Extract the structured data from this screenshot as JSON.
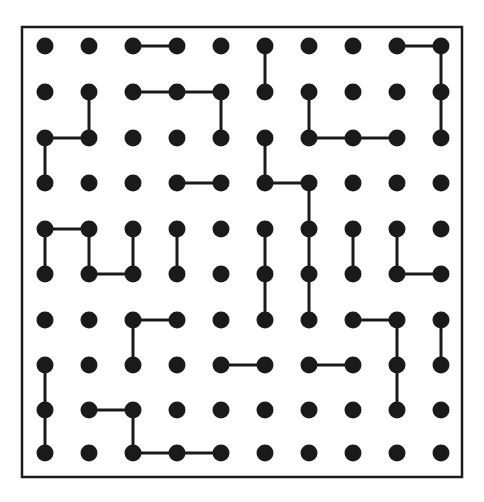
{
  "canvas": {
    "width": 484,
    "height": 502,
    "background": "#ffffff"
  },
  "frame": {
    "label": "puzzle-border",
    "x": 22,
    "y": 27,
    "width": 440,
    "height": 450,
    "stroke": "#1a1a1a",
    "stroke_width": 2.5,
    "fill": "#ffffff"
  },
  "grid": {
    "rows": 10,
    "cols": 10,
    "col_x": [
      45,
      89,
      133,
      177,
      221,
      265,
      309,
      353,
      397,
      441
    ],
    "row_y": [
      46,
      92,
      138,
      183,
      229,
      274,
      320,
      365,
      410,
      453
    ],
    "dot_radius": 8.5,
    "dot_color": "#1a1a1a",
    "edge_color": "#1a1a1a",
    "edge_width": 3
  },
  "edges": {
    "horizontal": [
      {
        "row": 0,
        "col_from": 2,
        "col_to": 3
      },
      {
        "row": 0,
        "col_from": 8,
        "col_to": 9
      },
      {
        "row": 1,
        "col_from": 2,
        "col_to": 3
      },
      {
        "row": 1,
        "col_from": 3,
        "col_to": 4
      },
      {
        "row": 2,
        "col_from": 0,
        "col_to": 1
      },
      {
        "row": 2,
        "col_from": 6,
        "col_to": 7
      },
      {
        "row": 2,
        "col_from": 7,
        "col_to": 8
      },
      {
        "row": 3,
        "col_from": 3,
        "col_to": 4
      },
      {
        "row": 3,
        "col_from": 5,
        "col_to": 6
      },
      {
        "row": 4,
        "col_from": 0,
        "col_to": 1
      },
      {
        "row": 5,
        "col_from": 1,
        "col_to": 2
      },
      {
        "row": 5,
        "col_from": 8,
        "col_to": 9
      },
      {
        "row": 6,
        "col_from": 2,
        "col_to": 3
      },
      {
        "row": 6,
        "col_from": 7,
        "col_to": 8
      },
      {
        "row": 7,
        "col_from": 4,
        "col_to": 5
      },
      {
        "row": 7,
        "col_from": 6,
        "col_to": 7
      },
      {
        "row": 8,
        "col_from": 1,
        "col_to": 2
      },
      {
        "row": 9,
        "col_from": 2,
        "col_to": 3
      },
      {
        "row": 9,
        "col_from": 3,
        "col_to": 4
      }
    ],
    "vertical": [
      {
        "col": 5,
        "row_from": 0,
        "row_to": 1
      },
      {
        "col": 9,
        "row_from": 0,
        "row_to": 1
      },
      {
        "col": 1,
        "row_from": 1,
        "row_to": 2
      },
      {
        "col": 4,
        "row_from": 1,
        "row_to": 2
      },
      {
        "col": 6,
        "row_from": 1,
        "row_to": 2
      },
      {
        "col": 9,
        "row_from": 1,
        "row_to": 2
      },
      {
        "col": 0,
        "row_from": 2,
        "row_to": 3
      },
      {
        "col": 5,
        "row_from": 2,
        "row_to": 3
      },
      {
        "col": 6,
        "row_from": 3,
        "row_to": 4
      },
      {
        "col": 0,
        "row_from": 4,
        "row_to": 5
      },
      {
        "col": 1,
        "row_from": 4,
        "row_to": 5
      },
      {
        "col": 2,
        "row_from": 4,
        "row_to": 5
      },
      {
        "col": 3,
        "row_from": 4,
        "row_to": 5
      },
      {
        "col": 5,
        "row_from": 4,
        "row_to": 5
      },
      {
        "col": 6,
        "row_from": 4,
        "row_to": 5
      },
      {
        "col": 7,
        "row_from": 4,
        "row_to": 5
      },
      {
        "col": 8,
        "row_from": 4,
        "row_to": 5
      },
      {
        "col": 5,
        "row_from": 5,
        "row_to": 6
      },
      {
        "col": 6,
        "row_from": 5,
        "row_to": 6
      },
      {
        "col": 2,
        "row_from": 6,
        "row_to": 7
      },
      {
        "col": 8,
        "row_from": 6,
        "row_to": 7
      },
      {
        "col": 9,
        "row_from": 6,
        "row_to": 7
      },
      {
        "col": 8,
        "row_from": 7,
        "row_to": 8
      },
      {
        "col": 0,
        "row_from": 7,
        "row_to": 8
      },
      {
        "col": 0,
        "row_from": 8,
        "row_to": 9
      },
      {
        "col": 2,
        "row_from": 8,
        "row_to": 9
      }
    ]
  }
}
